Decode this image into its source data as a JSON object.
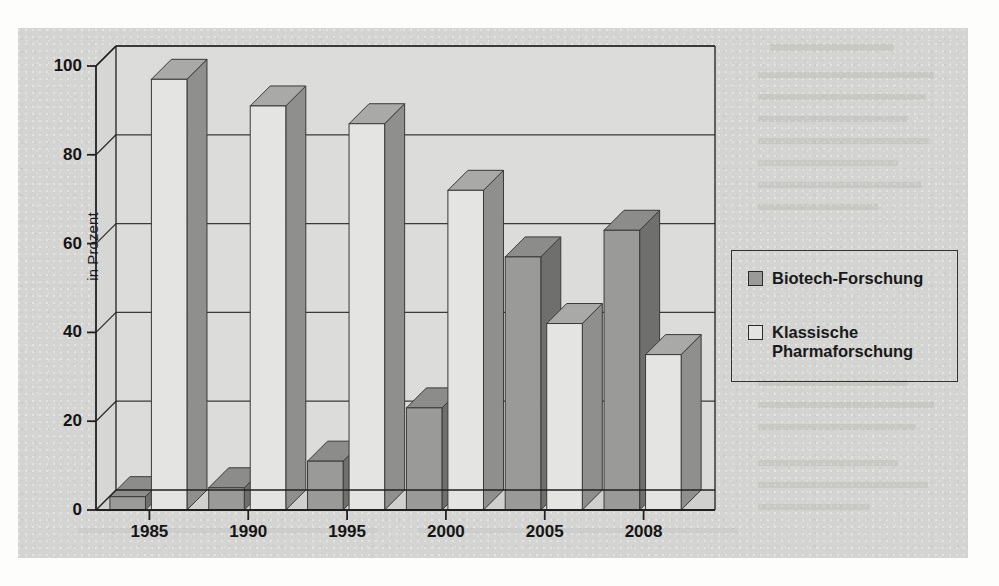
{
  "chart_data": {
    "type": "bar",
    "title": "",
    "xlabel": "",
    "ylabel": "in Prozent",
    "ylim": [
      0,
      100
    ],
    "yticks": [
      0,
      20,
      40,
      60,
      80,
      100
    ],
    "ytick_labels": [
      "0",
      "20",
      "40",
      "60",
      "80",
      "100"
    ],
    "grid": true,
    "legend_position": "right",
    "style": "3d-bars",
    "categories": [
      "1985",
      "1990",
      "1995",
      "2000",
      "2005",
      "2008"
    ],
    "series": [
      {
        "name": "Biotech-Forschung",
        "swatch": "filled",
        "color": "#9a9a98",
        "values": [
          3,
          5,
          11,
          23,
          57,
          63
        ]
      },
      {
        "name": "Klassische Pharmaforschung",
        "swatch": "empty",
        "color": "#e4e4e2",
        "values": [
          97,
          91,
          87,
          72,
          42,
          35
        ]
      }
    ]
  },
  "axis": {
    "y_title": "in Prozent"
  },
  "legend": {
    "items": [
      {
        "label": "Biotech-Forschung"
      },
      {
        "label": "Klassische\nPharmaforschung"
      }
    ]
  },
  "colors": {
    "paper": "#d4d4d2",
    "plot_background": "#dcdcda",
    "bar_front_biotech": "#9a9a98",
    "bar_front_klassisch": "#e4e4e2",
    "bar_side_dark": "#6f6f6d",
    "bar_top": "#8c8c8a",
    "axis_line": "#2b2b2b",
    "text": "#151515"
  }
}
